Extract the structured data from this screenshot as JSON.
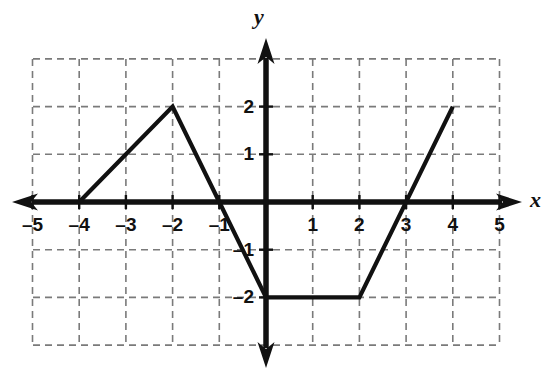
{
  "figure": {
    "kind": "coordinate-plane-piecewise-graph",
    "axis_labels": {
      "x": "x",
      "y": "y"
    },
    "background_color": "#ffffff",
    "curve_color": "#111111",
    "axis_color": "#111111",
    "grid_color": "#7a7a7a"
  },
  "chart_data": {
    "type": "line",
    "title": "",
    "xlabel": "x",
    "ylabel": "y",
    "xlim": [
      -5,
      5
    ],
    "ylim": [
      -3,
      3
    ],
    "grid": true,
    "grid_style": "dashed",
    "legend": "none",
    "xticks": [
      -5,
      -4,
      -3,
      -2,
      -1,
      1,
      2,
      3,
      4,
      5
    ],
    "xtick_labels": [
      "–5",
      "–4",
      "–3",
      "–2",
      "–1",
      "1",
      "2",
      "3",
      "4",
      "5"
    ],
    "yticks": [
      2,
      1,
      -1,
      -2
    ],
    "ytick_labels": [
      "2",
      "1",
      "–1",
      "–2"
    ],
    "series": [
      {
        "name": "piecewise",
        "x": [
          -4,
          -2,
          -1,
          0,
          2,
          4
        ],
        "y": [
          0,
          2,
          0,
          -2,
          -2,
          2
        ]
      }
    ],
    "vertices": [
      {
        "x": -4,
        "y": 0
      },
      {
        "x": -2,
        "y": 2
      },
      {
        "x": -1,
        "y": 0
      },
      {
        "x": 0,
        "y": -2
      },
      {
        "x": 2,
        "y": -2
      },
      {
        "x": 4,
        "y": 2
      }
    ]
  },
  "geometry": {
    "origin_px": {
      "x": 266,
      "y": 202
    },
    "unit_px": {
      "x": 46.7,
      "y": 47.7
    },
    "grid_extent_px": {
      "left": 33,
      "right": 500,
      "top": 59,
      "bottom": 345
    },
    "grid_extent_units": {
      "xmin": -5,
      "xmax": 5,
      "ymin": -3,
      "ymax": 3
    }
  }
}
